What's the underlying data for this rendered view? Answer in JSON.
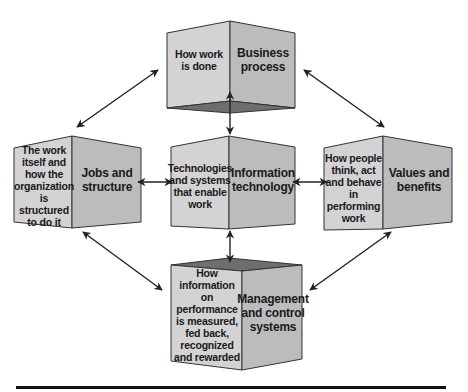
{
  "colors": {
    "face_left": "#d3d3d3",
    "face_right": "#bcbcbc",
    "face_dark": "#6e6e6e",
    "edge": "#333333",
    "arrow": "#222222",
    "text": "#1a1a1a"
  },
  "boxes": [
    {
      "id": "business-process",
      "title": "Business process",
      "description": "How work is done"
    },
    {
      "id": "jobs-and-structure",
      "title": "Jobs and structure",
      "description": "The work itself and how the organization is structured to do it"
    },
    {
      "id": "information-technology",
      "title": "Information technology",
      "description": "Technologies and systems that enable work"
    },
    {
      "id": "values-and-benefits",
      "title": "Values and benefits",
      "description": "How people think, act and behave in performing work"
    },
    {
      "id": "management-and-control-systems",
      "title": "Management and control systems",
      "description": "How information on performance is measured, fed back, recognized and rewarded"
    }
  ],
  "labels": {
    "bp_desc": "How work is done",
    "bp_title": "Business process",
    "js_desc": "The work itself and how the organization is structured to do it",
    "js_title": "Jobs and structure",
    "it_desc": "Technologies and systems that enable work",
    "it_title": "Information technology",
    "vb_desc": "How people think, act and behave in performing work",
    "vb_title": "Values and benefits",
    "mc_desc": "How information on performance is measured, fed back, recognized and rewarded",
    "mc_title": "Management and control systems"
  },
  "connections": [
    {
      "from": "business-process",
      "to": "jobs-and-structure",
      "type": "bidirectional"
    },
    {
      "from": "business-process",
      "to": "values-and-benefits",
      "type": "bidirectional"
    },
    {
      "from": "business-process",
      "to": "information-technology",
      "type": "bidirectional"
    },
    {
      "from": "jobs-and-structure",
      "to": "information-technology",
      "type": "bidirectional"
    },
    {
      "from": "information-technology",
      "to": "values-and-benefits",
      "type": "bidirectional"
    },
    {
      "from": "information-technology",
      "to": "management-and-control-systems",
      "type": "bidirectional"
    },
    {
      "from": "jobs-and-structure",
      "to": "management-and-control-systems",
      "type": "bidirectional"
    },
    {
      "from": "values-and-benefits",
      "to": "management-and-control-systems",
      "type": "bidirectional"
    }
  ]
}
